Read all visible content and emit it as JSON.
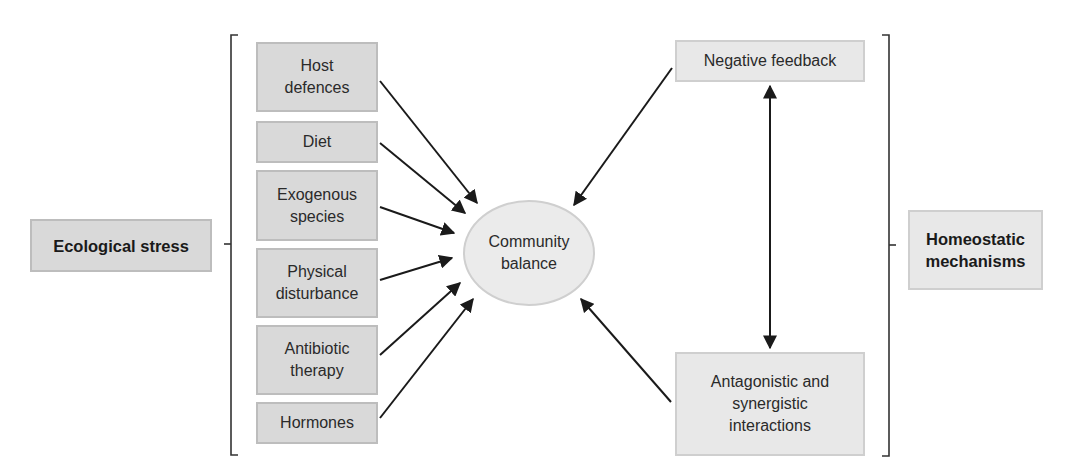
{
  "diagram": {
    "left_group": {
      "title": "Ecological stress",
      "factors": [
        {
          "label": "Host\ndefences"
        },
        {
          "label": "Diet"
        },
        {
          "label": "Exogenous\nspecies"
        },
        {
          "label": "Physical\ndisturbance"
        },
        {
          "label": "Antibiotic\ntherapy"
        },
        {
          "label": "Hormones"
        }
      ]
    },
    "center": {
      "label": "Community\nbalance"
    },
    "right_group": {
      "title": "Homeostatic\nmechanisms",
      "mechanisms": [
        {
          "label": "Negative feedback"
        },
        {
          "label": "Antagonistic and\nsynergistic\ninteractions"
        }
      ]
    },
    "edges": [
      {
        "from": "Host defences",
        "to": "Community balance"
      },
      {
        "from": "Diet",
        "to": "Community balance"
      },
      {
        "from": "Exogenous species",
        "to": "Community balance"
      },
      {
        "from": "Physical disturbance",
        "to": "Community balance"
      },
      {
        "from": "Antibiotic therapy",
        "to": "Community balance"
      },
      {
        "from": "Hormones",
        "to": "Community balance"
      },
      {
        "from": "Negative feedback",
        "to": "Community balance"
      },
      {
        "from": "Antagonistic and synergistic interactions",
        "to": "Community balance"
      },
      {
        "from": "Negative feedback",
        "to": "Antagonistic and synergistic interactions",
        "bidirectional": true
      }
    ],
    "colors": {
      "box_fill_dark": "#d9d9d9",
      "box_fill_light": "#e8e8e8",
      "arrow": "#1a1a1a"
    }
  }
}
